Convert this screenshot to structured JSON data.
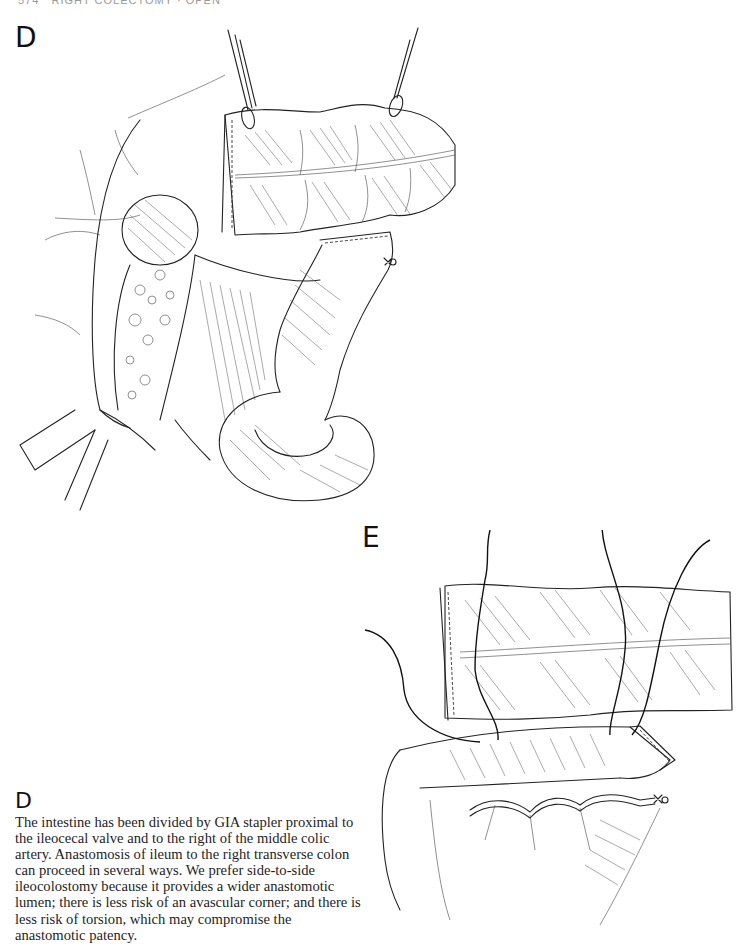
{
  "page": {
    "running_head": "574   RIGHT COLECTOMY · OPEN"
  },
  "figures": [
    {
      "label": "D",
      "description": "Surgical line illustration: right colon divided by GIA stapler; transverse colon held by Babcock clamps above, ileum curving below, retroperitoneal fat and mesentery exposed, retractor at lower left."
    },
    {
      "label": "E",
      "description": "Surgical line illustration: stapled transverse colon end aligned side-to-side with ileum, stay sutures placed through both limbs, mesenteric vessels ligated at right end."
    }
  ],
  "caption": {
    "heading": "D",
    "body": "The intestine has been divided by GIA stapler proximal to the ileocecal valve and to the right of the middle colic artery. Anastomosis of ileum to the right transverse colon can proceed in several ways. We prefer side-to-side ileocolostomy because it provides a wider anastomotic lumen; there is less risk of an avascular corner; and there is less risk of torsion, which may compromise the anastomotic patency."
  }
}
